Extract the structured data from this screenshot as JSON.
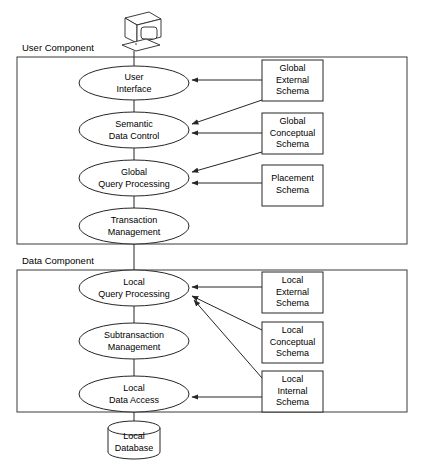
{
  "diagram": {
    "background_color": "#ffffff",
    "line_color": "#262626",
    "text_color": "#000000"
  },
  "terminal_icon": {
    "name": "computer-terminal-icon",
    "label": ""
  },
  "components": [
    {
      "id": "user-component",
      "label": "User Component"
    },
    {
      "id": "data-component",
      "label": "Data Component"
    }
  ],
  "user_component": {
    "label": "User Component",
    "nodes": [
      {
        "id": "user-interface",
        "line1": "User",
        "line2": "Interface"
      },
      {
        "id": "semantic-data-control",
        "line1": "Semantic",
        "line2": "Data Control"
      },
      {
        "id": "global-query-processing",
        "line1": "Global",
        "line2": "Query Processing"
      },
      {
        "id": "transaction-management",
        "line1": "Transaction",
        "line2": "Management"
      }
    ],
    "schemas": [
      {
        "id": "global-external-schema",
        "line1": "Global",
        "line2": "External",
        "line3": "Schema"
      },
      {
        "id": "global-conceptual-schema",
        "line1": "Global",
        "line2": "Conceptual",
        "line3": "Schema"
      },
      {
        "id": "placement-schema",
        "line1": "Placement",
        "line2": "Schema",
        "line3": ""
      }
    ]
  },
  "data_component": {
    "label": "Data Component",
    "nodes": [
      {
        "id": "local-query-processing",
        "line1": "Local",
        "line2": "Query Processing"
      },
      {
        "id": "subtransaction-management",
        "line1": "Subtransaction",
        "line2": "Management"
      },
      {
        "id": "local-data-access",
        "line1": "Local",
        "line2": "Data Access"
      }
    ],
    "schemas": [
      {
        "id": "local-external-schema",
        "line1": "Local",
        "line2": "External",
        "line3": "Schema"
      },
      {
        "id": "local-conceptual-schema",
        "line1": "Local",
        "line2": "Conceptual",
        "line3": "Schema"
      },
      {
        "id": "local-internal-schema",
        "line1": "Local",
        "line2": "Internal",
        "line3": "Schema"
      }
    ],
    "database": {
      "id": "local-database",
      "line1": "Local",
      "line2": "Database"
    }
  },
  "arrows": [
    {
      "from": "global-external-schema",
      "to": "user-interface"
    },
    {
      "from": "global-external-schema",
      "to": "semantic-data-control"
    },
    {
      "from": "global-conceptual-schema",
      "to": "semantic-data-control"
    },
    {
      "from": "global-conceptual-schema",
      "to": "global-query-processing"
    },
    {
      "from": "placement-schema",
      "to": "global-query-processing"
    },
    {
      "from": "local-external-schema",
      "to": "local-query-processing"
    },
    {
      "from": "local-conceptual-schema",
      "to": "local-query-processing"
    },
    {
      "from": "local-internal-schema",
      "to": "local-query-processing"
    },
    {
      "from": "local-internal-schema",
      "to": "local-data-access"
    }
  ]
}
